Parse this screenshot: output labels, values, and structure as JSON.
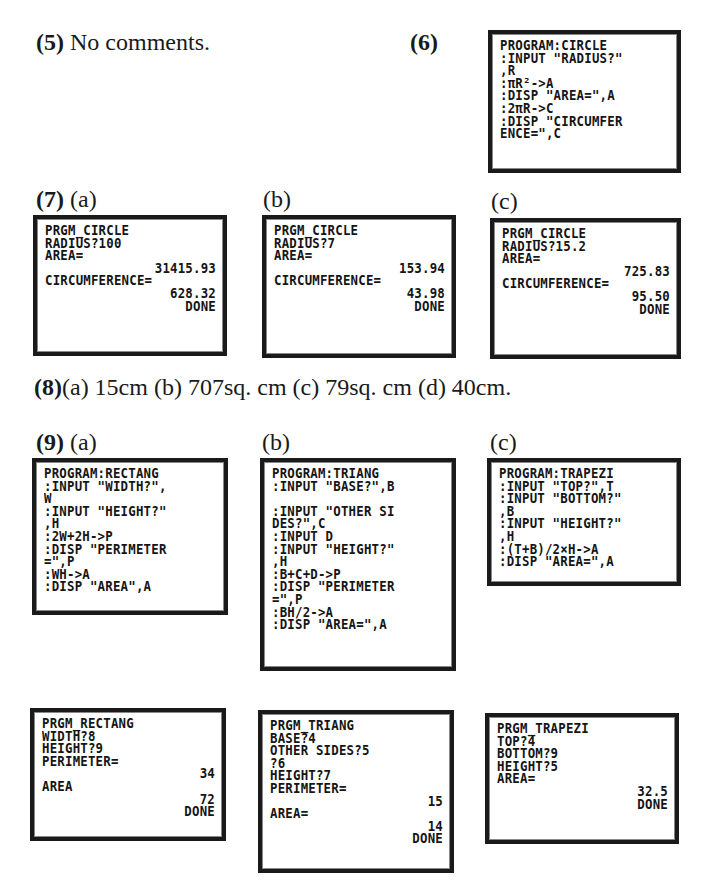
{
  "q5": {
    "num": "(5)",
    "text": " No comments."
  },
  "q6": {
    "num": "(6)",
    "screen": [
      "PROGRAM:CIRCLE",
      ":INPUT \"RADIUS?\"",
      ",R",
      ":πR²->A",
      ":DISP \"AREA=\",A",
      ":2πR->C",
      ":DISP \"CIRCUMFER",
      "ENCE=\",C"
    ]
  },
  "q7": {
    "num": "(7)",
    "parts": [
      {
        "label": "(a)",
        "screen": [
          {
            "t": "PRGM_CIRCLE"
          },
          {
            "t": "RADIUS?100"
          },
          {
            "t": "AREA="
          },
          {
            "t": "31415.93",
            "r": true
          },
          {
            "t": "CIRCUMFERENCE="
          },
          {
            "t": "628.32",
            "r": true
          },
          {
            "t": "DONE",
            "r": true
          }
        ]
      },
      {
        "label": "(b)",
        "screen": [
          {
            "t": "PRGM_CIRCLE"
          },
          {
            "t": "RADIUS?7"
          },
          {
            "t": "AREA="
          },
          {
            "t": "153.94",
            "r": true
          },
          {
            "t": "CIRCUMFERENCE="
          },
          {
            "t": "43.98",
            "r": true
          },
          {
            "t": "DONE",
            "r": true
          }
        ]
      },
      {
        "label": "(c)",
        "screen": [
          {
            "t": "PRGM_CIRCLE"
          },
          {
            "t": "RADIUS?15.2"
          },
          {
            "t": "AREA="
          },
          {
            "t": "725.83",
            "r": true
          },
          {
            "t": "CIRCUMFERENCE="
          },
          {
            "t": "95.50",
            "r": true
          },
          {
            "t": "DONE",
            "r": true
          }
        ]
      }
    ]
  },
  "q8": {
    "num": "(8)",
    "text": "(a) 15cm (b) 707sq. cm (c) 79sq. cm (d) 40cm."
  },
  "q9": {
    "num": "(9)",
    "parts": [
      {
        "label": "(a)",
        "program": [
          "PROGRAM:RECTANG",
          ":INPUT \"WIDTH?\",",
          "W",
          ":INPUT \"HEIGHT?\"",
          ",H",
          ":2W+2H->P",
          ":DISP \"PERIMETER",
          "=\",P",
          ":WH->A",
          ":DISP \"AREA\",A"
        ],
        "output": [
          {
            "t": "PRGM_RECTANG"
          },
          {
            "t": "WIDTH?8"
          },
          {
            "t": "HEIGHT?9"
          },
          {
            "t": "PERIMETER="
          },
          {
            "t": "34",
            "r": true
          },
          {
            "t": "AREA"
          },
          {
            "t": "72",
            "r": true
          },
          {
            "t": "DONE",
            "r": true
          }
        ]
      },
      {
        "label": "(b)",
        "program": [
          "PROGRAM:TRIANG",
          ":INPUT \"BASE?\",B",
          "",
          ":INPUT \"OTHER SI",
          "DES?\",C",
          ":INPUT D",
          ":INPUT \"HEIGHT?\"",
          ",H",
          ":B+C+D->P",
          ":DISP \"PERIMETER",
          "=\",P",
          ":BH/2->A",
          ":DISP \"AREA=\",A"
        ],
        "output": [
          {
            "t": "PRGM_TRIANG"
          },
          {
            "t": "BASE?4"
          },
          {
            "t": "OTHER SIDES?5"
          },
          {
            "t": "?6"
          },
          {
            "t": "HEIGHT?7"
          },
          {
            "t": "PERIMETER="
          },
          {
            "t": "15",
            "r": true
          },
          {
            "t": "AREA="
          },
          {
            "t": "14",
            "r": true
          },
          {
            "t": "DONE",
            "r": true
          }
        ]
      },
      {
        "label": "(c)",
        "program": [
          "PROGRAM:TRAPEZI",
          ":INPUT \"TOP?\",T",
          ":INPUT \"BOTTOM?\"",
          ",B",
          ":INPUT \"HEIGHT?\"",
          ",H",
          ":(T+B)/2×H->A",
          ":DISP \"AREA=\",A"
        ],
        "output": [
          {
            "t": "PRGM_TRAPEZI"
          },
          {
            "t": "TOP?4"
          },
          {
            "t": "BOTTOM?9"
          },
          {
            "t": "HEIGHT?5"
          },
          {
            "t": "AREA="
          },
          {
            "t": "32.5",
            "r": true
          },
          {
            "t": "DONE",
            "r": true
          }
        ]
      }
    ]
  }
}
